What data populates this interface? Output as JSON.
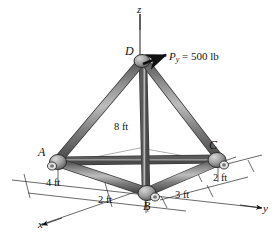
{
  "figure": {
    "background_color": "#ffffff",
    "member_color": "#6e6e6e",
    "member_dark": "#3c3c3c",
    "joint_color": "#9a9a9a",
    "line_color": "#1a1a1a",
    "shadow_color": "#c9c9c9"
  },
  "axes": [
    {
      "name": "z-axis",
      "label": "z"
    },
    {
      "name": "y-axis",
      "label": "y"
    },
    {
      "name": "x-axis",
      "label": "x"
    }
  ],
  "vertices": [
    {
      "name": "joint-a",
      "label": "A"
    },
    {
      "name": "joint-b",
      "label": "B"
    },
    {
      "name": "joint-c",
      "label": "C"
    },
    {
      "name": "joint-d",
      "label": "D"
    }
  ],
  "dimensions": [
    {
      "name": "height-dimension",
      "label": "8 ft"
    },
    {
      "name": "x-dimension-4ft",
      "label": "4 ft"
    },
    {
      "name": "x-dimension-2ft",
      "label": "2 ft"
    },
    {
      "name": "y-dimension-3ft",
      "label": "3 ft"
    },
    {
      "name": "y-dimension-2ft",
      "label": "2 ft"
    }
  ],
  "force": {
    "name": "applied-load",
    "symbol": "P",
    "subscript": "y",
    "equals": " = ",
    "value": "500 lb",
    "full_label": "Py = 500 lb"
  }
}
